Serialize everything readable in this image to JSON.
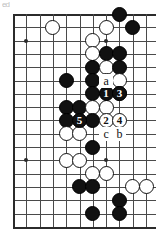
{
  "figure": {
    "kind": "go-board-diagram",
    "artifact_text": "ed",
    "board": {
      "left": 13,
      "top": 14,
      "spacing": 13.3,
      "cols": 11,
      "rows": 17,
      "line_color": "#4a4a4a",
      "edge_color": "#2b2b2b",
      "background": "#ffffff"
    },
    "hoshi": [
      {
        "c": 2,
        "r": 3
      },
      {
        "c": 2,
        "r": 12
      },
      {
        "c": 8,
        "r": 3
      },
      {
        "c": 8,
        "r": 12
      }
    ],
    "stones": [
      {
        "c": 9,
        "r": 1,
        "color": "black"
      },
      {
        "c": 10,
        "r": 2,
        "color": "black"
      },
      {
        "c": 4,
        "r": 2,
        "color": "white"
      },
      {
        "c": 8,
        "r": 2,
        "color": "white"
      },
      {
        "c": 7,
        "r": 3,
        "color": "white"
      },
      {
        "c": 7,
        "r": 4,
        "color": "white"
      },
      {
        "c": 8,
        "r": 4,
        "color": "black"
      },
      {
        "c": 9,
        "r": 4,
        "color": "black"
      },
      {
        "c": 7,
        "r": 5,
        "color": "black"
      },
      {
        "c": 8,
        "r": 5,
        "color": "white"
      },
      {
        "c": 9,
        "r": 5,
        "color": "black"
      },
      {
        "c": 5,
        "r": 6,
        "color": "black"
      },
      {
        "c": 7,
        "r": 6,
        "color": "black"
      },
      {
        "c": 8,
        "r": 6,
        "color": "white"
      },
      {
        "c": 9,
        "r": 6,
        "color": "white"
      },
      {
        "c": 7,
        "r": 7,
        "color": "black"
      },
      {
        "c": 9,
        "r": 7,
        "color": "white"
      },
      {
        "c": 5,
        "r": 8,
        "color": "black"
      },
      {
        "c": 6,
        "r": 8,
        "color": "black"
      },
      {
        "c": 7,
        "r": 8,
        "color": "white"
      },
      {
        "c": 8,
        "r": 8,
        "color": "white"
      },
      {
        "c": 5,
        "r": 9,
        "color": "black"
      },
      {
        "c": 6,
        "r": 9,
        "color": "white"
      },
      {
        "c": 7,
        "r": 9,
        "color": "black"
      },
      {
        "c": 5,
        "r": 10,
        "color": "white"
      },
      {
        "c": 6,
        "r": 10,
        "color": "white"
      },
      {
        "c": 7,
        "r": 11,
        "color": "black"
      },
      {
        "c": 5,
        "r": 12,
        "color": "white"
      },
      {
        "c": 6,
        "r": 12,
        "color": "white"
      },
      {
        "c": 7,
        "r": 13,
        "color": "white"
      },
      {
        "c": 8,
        "r": 13,
        "color": "white"
      },
      {
        "c": 6,
        "r": 14,
        "color": "black"
      },
      {
        "c": 7,
        "r": 14,
        "color": "black"
      },
      {
        "c": 10,
        "r": 14,
        "color": "white"
      },
      {
        "c": 11,
        "r": 14,
        "color": "white"
      },
      {
        "c": 9,
        "r": 15,
        "color": "black"
      },
      {
        "c": 7,
        "r": 16,
        "color": "black"
      },
      {
        "c": 9,
        "r": 16,
        "color": "black"
      }
    ],
    "move_stones": [
      {
        "c": 8,
        "r": 7,
        "color": "black",
        "number": "1"
      },
      {
        "c": 9,
        "r": 7,
        "color": "black",
        "number": "3"
      },
      {
        "c": 6,
        "r": 9,
        "color": "black",
        "number": "5"
      },
      {
        "c": 8,
        "r": 9,
        "color": "white",
        "number": "2"
      },
      {
        "c": 9,
        "r": 9,
        "color": "white",
        "number": "4"
      }
    ],
    "point_labels": [
      {
        "c": 8,
        "r": 6,
        "text": "a"
      },
      {
        "c": 8,
        "r": 10,
        "text": "c"
      },
      {
        "c": 9,
        "r": 10,
        "text": "b"
      }
    ]
  }
}
